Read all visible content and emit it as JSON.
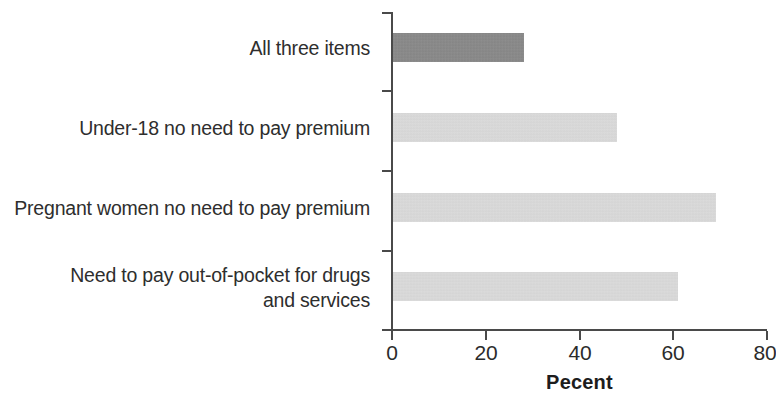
{
  "chart_data": {
    "type": "bar",
    "orientation": "horizontal",
    "title": "",
    "subtitle": "",
    "xlabel": "Pecent",
    "ylabel": "",
    "xlim": [
      0,
      80
    ],
    "x_ticks": [
      0,
      20,
      40,
      60,
      80
    ],
    "x_tick_labels": [
      "0",
      "20",
      "40",
      "60",
      "80"
    ],
    "grid": false,
    "legend": null,
    "categories": [
      "All three items",
      "Under-18 no need to pay premium",
      "Pregnant women no need to pay premium",
      "Need to pay out-of-pocket for drugs\nand services"
    ],
    "values": [
      28,
      48,
      69,
      61
    ],
    "bar_colors": [
      "#838383",
      "#d2d2d2",
      "#d2d2d2",
      "#d2d2d2"
    ],
    "series": [
      {
        "name": "Pecent",
        "values": [
          28,
          48,
          69,
          61
        ]
      }
    ],
    "points": [
      {
        "category": "All three items",
        "value": 28
      },
      {
        "category": "Under-18 no need to pay premium",
        "value": 48
      },
      {
        "category": "Pregnant women no need to pay premium",
        "value": 69
      },
      {
        "category": "Need to pay out-of-pocket for drugs and services",
        "value": 61
      }
    ]
  },
  "colors": {
    "bar_dark": "#838383",
    "bar_light": "#d2d2d2",
    "axis": "#4a4a4a",
    "text": "#2e2e2e",
    "background": "#ffffff"
  },
  "axis": {
    "x_title": "Pecent",
    "tick_0": "0",
    "tick_1": "20",
    "tick_2": "40",
    "tick_3": "60",
    "tick_4": "80"
  },
  "labels": {
    "cat_0": "All three items",
    "cat_1": "Under-18 no need to pay premium",
    "cat_2": "Pregnant women no need to pay premium",
    "cat_3": "Need to pay out-of-pocket for drugs\nand services"
  }
}
